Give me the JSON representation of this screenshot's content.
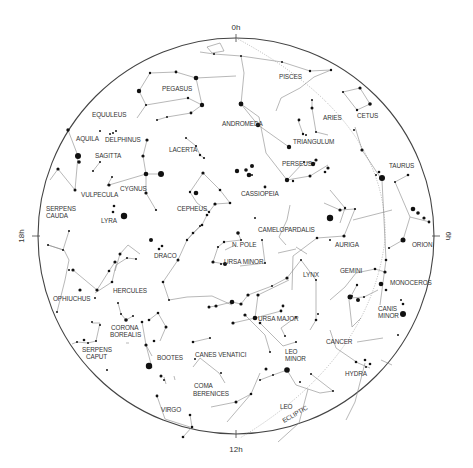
{
  "chart": {
    "center": [
      236,
      236
    ],
    "radius": 198,
    "colors": {
      "rim": "#444444",
      "lines": "#888888",
      "stars": "#111111",
      "labels": "#333333"
    }
  },
  "hour_labels": [
    {
      "text": "0h",
      "x": 236,
      "y": 30,
      "rotate": 0
    },
    {
      "text": "6h",
      "x": 446,
      "y": 236,
      "rotate": 90
    },
    {
      "text": "12h",
      "x": 236,
      "y": 452,
      "rotate": 0
    },
    {
      "text": "18h",
      "x": 24,
      "y": 236,
      "rotate": -90
    }
  ],
  "constellation_labels": [
    {
      "name": "PISCES",
      "x": 279,
      "y": 79
    },
    {
      "name": "CETUS",
      "x": 357,
      "y": 118
    },
    {
      "name": "PEGASUS",
      "x": 162,
      "y": 91
    },
    {
      "name": "ARIES",
      "x": 323,
      "y": 120
    },
    {
      "name": "EQUULEUS",
      "x": 92,
      "y": 117
    },
    {
      "name": "ANDROMEDA",
      "x": 222,
      "y": 126
    },
    {
      "name": "TRIANGULUM",
      "x": 293,
      "y": 144
    },
    {
      "name": "AQUILA",
      "x": 76,
      "y": 141
    },
    {
      "name": "DELPHINUS",
      "x": 105,
      "y": 142
    },
    {
      "name": "LACERTA",
      "x": 169,
      "y": 152
    },
    {
      "name": "PERSEUS",
      "x": 282,
      "y": 166
    },
    {
      "name": "TAURUS",
      "x": 389,
      "y": 168
    },
    {
      "name": "SAGITTA",
      "x": 95,
      "y": 158
    },
    {
      "name": "CYGNUS",
      "x": 120,
      "y": 191
    },
    {
      "name": "CASSIOPEIA",
      "x": 241,
      "y": 196
    },
    {
      "name": "VULPECULA",
      "x": 81,
      "y": 197
    },
    {
      "name": "CEPHEUS",
      "x": 177,
      "y": 211
    },
    {
      "name": "SERPENS",
      "x": 46,
      "y": 211
    },
    {
      "name": "CAUDA",
      "x": 46,
      "y": 218
    },
    {
      "name": "LYRA",
      "x": 101,
      "y": 223
    },
    {
      "name": "CAMELOPARDALIS",
      "x": 258,
      "y": 232
    },
    {
      "name": "ORION",
      "x": 412,
      "y": 247
    },
    {
      "name": "AURIGA",
      "x": 335,
      "y": 247
    },
    {
      "name": "N. POLE",
      "x": 232,
      "y": 247
    },
    {
      "name": "DRACO",
      "x": 154,
      "y": 258
    },
    {
      "name": "URSA MINOR",
      "x": 224,
      "y": 264
    },
    {
      "name": "LYNX",
      "x": 303,
      "y": 277
    },
    {
      "name": "GEMINI",
      "x": 340,
      "y": 273
    },
    {
      "name": "MONOCEROS",
      "x": 390,
      "y": 285
    },
    {
      "name": "HERCULES",
      "x": 113,
      "y": 293
    },
    {
      "name": "OPHIUCHUS",
      "x": 53,
      "y": 301
    },
    {
      "name": "URSA MAJOR",
      "x": 258,
      "y": 321
    },
    {
      "name": "CANIS",
      "x": 378,
      "y": 311
    },
    {
      "name": "MINOR",
      "x": 378,
      "y": 318
    },
    {
      "name": "CORONA",
      "x": 111,
      "y": 330
    },
    {
      "name": "BOREALIS",
      "x": 110,
      "y": 337
    },
    {
      "name": "LEO",
      "x": 285,
      "y": 354
    },
    {
      "name": "MINOR",
      "x": 285,
      "y": 361
    },
    {
      "name": "CANCER",
      "x": 326,
      "y": 344
    },
    {
      "name": "SERPENS",
      "x": 82,
      "y": 352
    },
    {
      "name": "CAPUT",
      "x": 86,
      "y": 359
    },
    {
      "name": "BOOTES",
      "x": 157,
      "y": 360
    },
    {
      "name": "CANES VENATICI",
      "x": 195,
      "y": 357
    },
    {
      "name": "HYDRA",
      "x": 345,
      "y": 376
    },
    {
      "name": "COMA",
      "x": 194,
      "y": 388
    },
    {
      "name": "BERENICES",
      "x": 193,
      "y": 396
    },
    {
      "name": "LEO",
      "x": 280,
      "y": 409
    },
    {
      "name": "VIRGO",
      "x": 161,
      "y": 412
    },
    {
      "name": "ECLIPTIC",
      "x": 284,
      "y": 423,
      "rotate": -30
    }
  ],
  "ecliptic": "M 236 38 Q 390 120 385 240 Q 370 360 240 438",
  "constellation_lines": [
    "M 207 47 L 220 43 L 224 51 L 212 53 Z",
    "M 200 52 L 214 54 L 241 56 L 282 62 L 310 71 L 331 70 L 314 77 L 300 88 L 281 98 L 276 111",
    "M 150 73 L 176 72 L 196 78 L 202 105 L 191 113 L 167 117 L 157 120",
    "M 150 73 L 139 91 L 146 105 L 137 118",
    "M 146 105 L 188 98 L 202 105",
    "M 196 78 L 236 76",
    "M 241 56 L 244 73 L 241 104 L 258 125 L 289 147",
    "M 343 92 L 360 88 L 370 104 L 357 110 L 343 92",
    "M 312 100 L 312 108 L 316 132 L 328 135",
    "M 298 120 L 303 134 L 304 135",
    "M 241 104 L 259 117 L 266 153 L 287 180 L 304 162 L 316 163",
    "M 287 180 L 310 176 L 328 165",
    "M 68 130 L 78 156 L 75 190 L 58 169 L 50 180",
    "M 147 140 L 143 156 L 146 174 L 146 193 L 156 210",
    "M 146 174 L 161 174",
    "M 109 185 L 146 174",
    "M 93 171 L 100 162",
    "M 112 177 L 107 186",
    "M 186 138 L 196 146 L 200 155 L 204 158",
    "M 203 173 L 220 190 L 230 203 L 215 204 L 209 212 L 197 203 L 190 192 L 203 173",
    "M 355 127 L 362 150 L 382 180",
    "M 382 180 L 386 260 L 380 305",
    "M 408 175 L 395 182 L 410 217 L 403 240 L 389 248",
    "M 410 217 L 430 222",
    "M 355 209 L 344 236 L 317 238 L 293 256 L 292 290",
    "M 324 203 L 340 210 L 355 209",
    "M 330 190 L 345 208 L 340 223",
    "M 353 220 L 392 210",
    "M 290 205 L 287 220 L 279 237 L 286 245",
    "M 296 247 L 307 254",
    "M 207 215 L 202 225 L 193 233 L 187 240 L 178 260 L 163 282 L 169 300 L 187 297 L 212 296 L 232 305",
    "M 187 240 L 200 226",
    "M 238 233 L 241 240 L 224 242 L 218 247 L 213 262 L 225 264",
    "M 296 249 L 278 253",
    "M 225 250 L 235 245",
    "M 262 240 L 265 263 L 240 266",
    "M 301 260 L 316 280 L 316 320 L 310 330",
    "M 330 300 L 345 287 L 356 273 L 375 269 L 385 272",
    "M 357 285 L 350 298 L 364 297 L 378 290",
    "M 349 300 L 352 327 L 361 318",
    "M 287 278 L 301 260",
    "M 330 330 L 336 348 L 358 363 L 370 368",
    "M 357 342 L 383 338",
    "M 365 363 L 355 402 L 346 420",
    "M 381 360 L 392 365",
    "M 287 278 L 272 286 L 248 295 L 241 304 L 232 302 L 216 306 L 209 307",
    "M 289 280 L 258 295 L 255 318 L 233 323",
    "M 255 318 L 281 311",
    "M 296 317 L 281 328 L 285 336",
    "M 260 323 L 283 346 L 296 342",
    "M 245 315 L 265 335 L 270 352",
    "M 260 380 L 273 375 L 287 370",
    "M 260 373 L 251 394 L 236 402 L 211 407",
    "M 251 394 L 227 422",
    "M 287 370 L 296 385 L 320 393 L 333 391 L 311 374",
    "M 308 389 L 299 423 L 278 442",
    "M 69 231 L 63 250 L 48 245",
    "M 48 245 L 64 250 L 69 260 L 65 280 L 57 312",
    "M 73 270 L 97 290 L 109 271 L 115 262",
    "M 95 293 L 112 282 L 116 265 L 127 258 L 136 259",
    "M 115 271 L 120 254 L 128 245 L 140 254",
    "M 118 303 L 121 314 L 126 320 L 133 316",
    "M 142 322 L 146 345 L 152 356",
    "M 158 313 L 166 327 L 160 341",
    "M 149 320 L 158 313",
    "M 92 323 L 100 323 L 96 341 L 88 343 L 77 342",
    "M 77 342 L 72 344",
    "M 129 343 L 126 343",
    "M 152 368 L 146 345",
    "M 164 377 L 166 384",
    "M 193 342 L 210 338",
    "M 193 367 L 200 358 L 219 373 L 225 383",
    "M 190 415 L 192 427 L 183 437",
    "M 175 380 L 174 376",
    "M 157 396 L 165 419 L 190 427"
  ],
  "stars": [
    [
      139,
      91,
      2.2
    ],
    [
      150,
      73,
      1.2
    ],
    [
      176,
      72,
      1.4
    ],
    [
      196,
      78,
      2.3
    ],
    [
      202,
      105,
      2.2
    ],
    [
      191,
      113,
      1.4
    ],
    [
      167,
      117,
      1.0
    ],
    [
      157,
      120,
      1.0
    ],
    [
      146,
      105,
      1.1
    ],
    [
      188,
      98,
      1.2
    ],
    [
      241,
      56,
      1.0
    ],
    [
      241,
      104,
      2.4
    ],
    [
      258,
      125,
      2.2
    ],
    [
      289,
      147,
      2.2
    ],
    [
      214,
      54,
      1.0
    ],
    [
      282,
      62,
      1.0
    ],
    [
      310,
      71,
      1.2
    ],
    [
      331,
      70,
      1.2
    ],
    [
      343,
      92,
      1.1
    ],
    [
      360,
      88,
      1.6
    ],
    [
      370,
      104,
      1.8
    ],
    [
      357,
      110,
      1.2
    ],
    [
      312,
      100,
      1.0
    ],
    [
      312,
      108,
      1.5
    ],
    [
      316,
      132,
      1.0
    ],
    [
      299,
      120,
      1.4
    ],
    [
      303,
      134,
      1.2
    ],
    [
      306,
      135,
      1.0
    ],
    [
      313,
      164,
      2.2
    ],
    [
      316,
      160,
      1.6
    ],
    [
      304,
      162,
      1.0
    ],
    [
      287,
      180,
      2.2
    ],
    [
      293,
      181,
      1.2
    ],
    [
      310,
      176,
      1.5
    ],
    [
      328,
      168,
      1.6
    ],
    [
      325,
      172,
      1.3
    ],
    [
      354,
      130,
      1.0
    ],
    [
      362,
      150,
      1.6
    ],
    [
      382,
      178,
      3.0
    ],
    [
      379,
      172,
      1.3
    ],
    [
      376,
      175,
      1.0
    ],
    [
      386,
      260,
      1.3
    ],
    [
      408,
      175,
      1.3
    ],
    [
      395,
      182,
      1.0
    ],
    [
      413,
      209,
      2.3
    ],
    [
      418,
      213,
      1.8
    ],
    [
      424,
      218,
      1.6
    ],
    [
      429,
      222,
      1.4
    ],
    [
      403,
      240,
      2.5
    ],
    [
      389,
      248,
      1.1
    ],
    [
      355,
      209,
      1.1
    ],
    [
      344,
      236,
      1.6
    ],
    [
      317,
      238,
      1.3
    ],
    [
      330,
      218,
      3.2
    ],
    [
      340,
      210,
      1.6
    ],
    [
      345,
      208,
      1.2
    ],
    [
      330,
      240,
      1.0
    ],
    [
      68,
      130,
      1.7
    ],
    [
      78,
      156,
      3.0
    ],
    [
      79,
      162,
      1.8
    ],
    [
      58,
      169,
      1.6
    ],
    [
      75,
      190,
      1.5
    ],
    [
      147,
      140,
      1.6
    ],
    [
      143,
      156,
      1.6
    ],
    [
      146,
      174,
      2.3
    ],
    [
      161,
      174,
      3.0
    ],
    [
      146,
      193,
      1.6
    ],
    [
      156,
      210,
      1.1
    ],
    [
      109,
      185,
      1.6
    ],
    [
      112,
      177,
      1.0
    ],
    [
      100,
      162,
      1.0
    ],
    [
      93,
      171,
      1.0
    ],
    [
      116,
      131,
      1.0
    ],
    [
      113,
      133,
      1.0
    ],
    [
      110,
      134,
      1.0
    ],
    [
      100,
      131,
      1.0
    ],
    [
      124,
      216,
      3.2
    ],
    [
      113,
      212,
      1.3
    ],
    [
      114,
      206,
      1.3
    ],
    [
      186,
      138,
      1.0
    ],
    [
      196,
      146,
      1.1
    ],
    [
      200,
      155,
      1.2
    ],
    [
      204,
      158,
      1.1
    ],
    [
      203,
      173,
      1.6
    ],
    [
      220,
      190,
      1.3
    ],
    [
      230,
      203,
      1.3
    ],
    [
      196,
      193,
      2.3
    ],
    [
      190,
      192,
      1.2
    ],
    [
      246,
      170,
      1.8
    ],
    [
      252,
      166,
      2.0
    ],
    [
      249,
      175,
      2.3
    ],
    [
      237,
      171,
      2.2
    ],
    [
      265,
      187,
      1.4
    ],
    [
      252,
      175,
      1.0
    ],
    [
      215,
      204,
      1.6
    ],
    [
      209,
      212,
      1.2
    ],
    [
      207,
      215,
      1.3
    ],
    [
      202,
      225,
      1.3
    ],
    [
      193,
      233,
      1.3
    ],
    [
      187,
      240,
      1.2
    ],
    [
      200,
      226,
      1.0
    ],
    [
      178,
      260,
      1.5
    ],
    [
      163,
      282,
      1.3
    ],
    [
      169,
      300,
      1.0
    ],
    [
      151,
      240,
      2.0
    ],
    [
      159,
      249,
      1.3
    ],
    [
      162,
      246,
      1.3
    ],
    [
      238,
      233,
      1.8
    ],
    [
      241,
      240,
      1.0
    ],
    [
      224,
      242,
      1.2
    ],
    [
      218,
      247,
      1.1
    ],
    [
      213,
      262,
      1.6
    ],
    [
      225,
      264,
      2.0
    ],
    [
      221,
      264,
      1.1
    ],
    [
      262,
      240,
      1.0
    ],
    [
      265,
      263,
      1.0
    ],
    [
      255,
      218,
      1.0
    ],
    [
      301,
      260,
      1.0
    ],
    [
      316,
      280,
      1.0
    ],
    [
      316,
      320,
      1.3
    ],
    [
      318,
      314,
      1.0
    ],
    [
      357,
      285,
      1.2
    ],
    [
      350,
      297,
      2.5
    ],
    [
      358,
      300,
      2.0
    ],
    [
      352,
      296,
      1.0
    ],
    [
      364,
      297,
      1.0
    ],
    [
      385,
      272,
      1.6
    ],
    [
      375,
      269,
      1.3
    ],
    [
      381,
      284,
      2.3
    ],
    [
      386,
      290,
      1.3
    ],
    [
      403,
      314,
      3.0
    ],
    [
      403,
      304,
      1.3
    ],
    [
      401,
      300,
      1.0
    ],
    [
      398,
      335,
      1.0
    ],
    [
      287,
      278,
      1.6
    ],
    [
      272,
      286,
      1.0
    ],
    [
      248,
      295,
      1.6
    ],
    [
      241,
      304,
      1.6
    ],
    [
      232,
      302,
      2.3
    ],
    [
      216,
      306,
      1.6
    ],
    [
      209,
      307,
      1.5
    ],
    [
      255,
      318,
      2.3
    ],
    [
      258,
      295,
      1.6
    ],
    [
      281,
      311,
      1.4
    ],
    [
      283,
      306,
      1.4
    ],
    [
      260,
      323,
      1.3
    ],
    [
      233,
      323,
      1.6
    ],
    [
      296,
      317,
      1.0
    ],
    [
      285,
      336,
      1.0
    ],
    [
      296,
      342,
      1.0
    ],
    [
      245,
      315,
      1.6
    ],
    [
      270,
      352,
      1.0
    ],
    [
      287,
      370,
      2.8
    ],
    [
      266,
      369,
      1.5
    ],
    [
      260,
      380,
      1.0
    ],
    [
      251,
      394,
      1.3
    ],
    [
      236,
      402,
      1.5
    ],
    [
      273,
      375,
      1.0
    ],
    [
      356,
      362,
      1.3
    ],
    [
      365,
      360,
      1.3
    ],
    [
      370,
      364,
      1.3
    ],
    [
      366,
      367,
      1.0
    ],
    [
      333,
      391,
      1.0
    ],
    [
      311,
      374,
      1.0
    ],
    [
      300,
      382,
      1.0
    ],
    [
      69,
      231,
      1.0
    ],
    [
      48,
      245,
      1.0
    ],
    [
      63,
      250,
      1.0
    ],
    [
      80,
      290,
      1.6
    ],
    [
      73,
      270,
      1.6
    ],
    [
      69,
      270,
      1.0
    ],
    [
      57,
      312,
      1.0
    ],
    [
      97,
      290,
      1.6
    ],
    [
      109,
      271,
      1.3
    ],
    [
      115,
      262,
      1.6
    ],
    [
      127,
      258,
      1.0
    ],
    [
      136,
      259,
      1.0
    ],
    [
      120,
      254,
      1.5
    ],
    [
      112,
      282,
      1.3
    ],
    [
      95,
      298,
      1.0
    ],
    [
      118,
      303,
      1.0
    ],
    [
      121,
      314,
      1.0
    ],
    [
      126,
      320,
      1.8
    ],
    [
      133,
      316,
      1.0
    ],
    [
      142,
      322,
      1.3
    ],
    [
      158,
      313,
      1.3
    ],
    [
      166,
      327,
      1.5
    ],
    [
      149,
      320,
      1.3
    ],
    [
      146,
      345,
      1.6
    ],
    [
      154,
      341,
      1.3
    ],
    [
      149,
      366,
      3.2
    ],
    [
      161,
      376,
      1.5
    ],
    [
      164,
      380,
      1.0
    ],
    [
      92,
      322,
      1.0
    ],
    [
      100,
      325,
      1.0
    ],
    [
      96,
      341,
      1.0
    ],
    [
      88,
      343,
      1.0
    ],
    [
      84,
      340,
      1.3
    ],
    [
      77,
      342,
      1.0
    ],
    [
      193,
      342,
      1.3
    ],
    [
      210,
      338,
      1.0
    ],
    [
      195,
      359,
      1.0
    ],
    [
      221,
      373,
      1.0
    ],
    [
      190,
      415,
      1.3
    ],
    [
      192,
      427,
      1.3
    ],
    [
      183,
      437,
      1.3
    ],
    [
      157,
      396,
      1.4
    ],
    [
      107,
      370,
      1.0
    ]
  ]
}
